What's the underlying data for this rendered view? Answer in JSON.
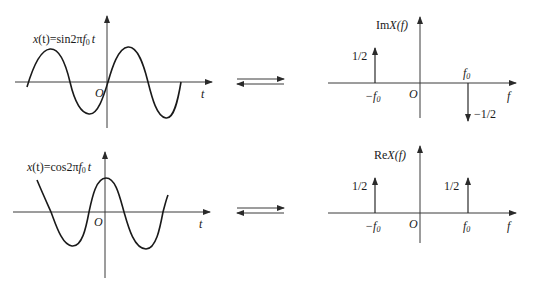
{
  "colors": {
    "ink": "#1a1a1a",
    "axis": "#3a3a3a",
    "background": "#ffffff"
  },
  "panels": {
    "sin_time": {
      "formula_prefix": "x",
      "formula_paren": "(t)=sin2π",
      "formula_f": "f",
      "formula_sub": "0",
      "formula_t": "t",
      "origin": "O",
      "x_axis_label": "t"
    },
    "sin_spectrum": {
      "y_label_prefix": "Im",
      "y_label_var": "X",
      "y_label_arg": "(f)",
      "origin": "O",
      "x_axis_label": "f",
      "neg_freq_label": "−f",
      "neg_freq_sub": "0",
      "pos_freq_label": "f",
      "pos_freq_sub": "0",
      "neg_spike_value": "1/2",
      "pos_spike_value": "−1/2"
    },
    "cos_time": {
      "formula_prefix": "x",
      "formula_paren": "(t)=cos2π",
      "formula_f": "f",
      "formula_sub": "0",
      "formula_t": "t",
      "origin": "O",
      "x_axis_label": "t"
    },
    "cos_spectrum": {
      "y_label_prefix": "Re",
      "y_label_var": "X",
      "y_label_arg": "(f)",
      "origin": "O",
      "x_axis_label": "f",
      "neg_freq_label": "−f",
      "neg_freq_sub": "0",
      "pos_freq_label": "f",
      "pos_freq_sub": "0",
      "neg_spike_value": "1/2",
      "pos_spike_value": "1/2"
    }
  },
  "transform_arrows": {
    "symbol": "⇄",
    "meaning": "Fourier transform pair"
  }
}
